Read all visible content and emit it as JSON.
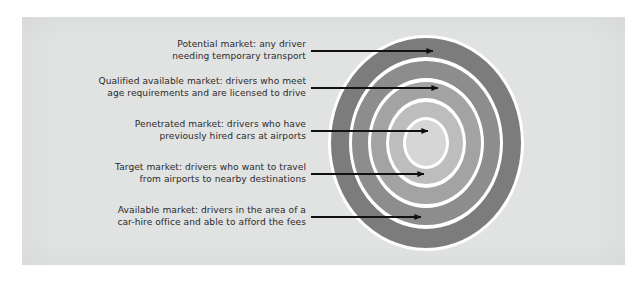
{
  "figure": {
    "kind": "concentric-circles-diagram",
    "panel_background": "#e1e2e2",
    "page_background": "#ffffff",
    "text_color": "#2b2b2b",
    "arrow_color": "#111111",
    "ring_separator_color": "#ffffff"
  },
  "chart_data": {
    "type": "pie",
    "title": "",
    "subtitle": "",
    "xlabel": "",
    "ylabel": "",
    "legend_position": "left",
    "grid": false,
    "center": {
      "x": 426,
      "y": 143
    },
    "rings": [
      {
        "index": 1,
        "name": "Potential market",
        "color": "#7c7c7c",
        "outer_rx": 95,
        "outer_ry": 105,
        "inner_rx": 77,
        "inner_ry": 86
      },
      {
        "index": 2,
        "name": "Qualified available market",
        "color": "#8d8d8d",
        "outer_rx": 74,
        "outer_ry": 82,
        "inner_rx": 58,
        "inner_ry": 65
      },
      {
        "index": 3,
        "name": "Available market",
        "color": "#a3a3a3",
        "outer_rx": 55,
        "outer_ry": 61,
        "inner_rx": 40,
        "inner_ry": 45
      },
      {
        "index": 4,
        "name": "Target market",
        "color": "#bdbdbd",
        "outer_rx": 37,
        "outer_ry": 41,
        "inner_rx": 23,
        "inner_ry": 26
      },
      {
        "index": 5,
        "name": "Penetrated market",
        "color": "#d6d6d6",
        "outer_rx": 20,
        "outer_ry": 23,
        "inner_rx": 0,
        "inner_ry": 0
      }
    ]
  },
  "callouts": [
    {
      "id": "potential-market",
      "lines": [
        "Potential market: any driver",
        "needing temporary transport"
      ],
      "label_right_x": 306,
      "label_top_y": 39,
      "arrow": {
        "x1": 311,
        "y1": 51,
        "x2": 433,
        "y2": 51
      }
    },
    {
      "id": "qualified-available-market",
      "lines": [
        "Qualified available market: drivers who meet",
        "age requirements and are licensed to drive"
      ],
      "label_right_x": 306,
      "label_top_y": 76,
      "arrow": {
        "x1": 311,
        "y1": 88,
        "x2": 438,
        "y2": 88
      }
    },
    {
      "id": "penetrated-market",
      "lines": [
        "Penetrated market: drivers who have",
        "previously hired cars at airports"
      ],
      "label_right_x": 306,
      "label_top_y": 119,
      "arrow": {
        "x1": 311,
        "y1": 131,
        "x2": 428,
        "y2": 131
      }
    },
    {
      "id": "target-market",
      "lines": [
        "Target market: drivers who want to travel",
        "from airports to nearby destinations"
      ],
      "label_right_x": 306,
      "label_top_y": 162,
      "arrow": {
        "x1": 311,
        "y1": 174,
        "x2": 424,
        "y2": 174
      }
    },
    {
      "id": "available-market",
      "lines": [
        "Available market: drivers in the area of a",
        "car-hire office and able to afford the fees"
      ],
      "label_right_x": 306,
      "label_top_y": 205,
      "arrow": {
        "x1": 311,
        "y1": 217,
        "x2": 421,
        "y2": 217
      }
    }
  ]
}
